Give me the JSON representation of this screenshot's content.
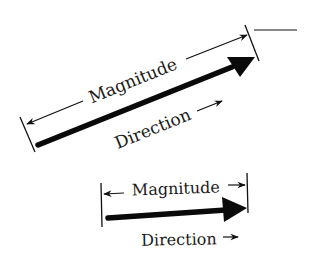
{
  "diagram": {
    "colors": {
      "ink": "#111111",
      "background": "#ffffff"
    },
    "figures": [
      {
        "id": "slanted-vector",
        "magnitude_label": "Magnitude",
        "direction_label": "Direction",
        "direction_arrow": "→",
        "angle_deg": -22
      },
      {
        "id": "horizontal-vector",
        "magnitude_label": "Magnitude",
        "direction_label": "Direction",
        "direction_arrow": "→",
        "angle_deg": -4
      }
    ]
  }
}
